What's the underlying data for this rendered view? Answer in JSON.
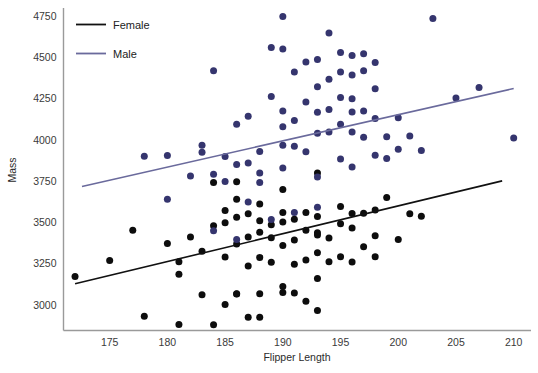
{
  "chart_data": {
    "type": "scatter",
    "title": "",
    "xlabel": "Flipper Length",
    "ylabel": "Mass",
    "xlim": [
      171.0,
      211.5
    ],
    "ylim": [
      2845,
      4800
    ],
    "xticks": [
      175,
      180,
      185,
      190,
      195,
      200,
      205,
      210
    ],
    "yticks": [
      3000,
      3250,
      3500,
      3750,
      4000,
      4250,
      4500,
      4750
    ],
    "grid": false,
    "legend_position": "top-left",
    "legend": [
      "Female",
      "Male"
    ],
    "colors": {
      "female_point": "#0d0d0d",
      "female_line": "#111111",
      "male_point": "#35356e",
      "male_line": "#6a6a9c",
      "axis": "#9a9a9a",
      "text": "#2b2b2b"
    },
    "series": [
      {
        "name": "Female",
        "marker_color": "#0d0d0d",
        "line_color": "#111111",
        "trend_line": {
          "x0": 172.0,
          "y0": 3128,
          "x1": 209.0,
          "y1": 3752
        },
        "points": [
          [
            172.0,
            3172
          ],
          [
            175.0,
            3270
          ],
          [
            177.0,
            3452
          ],
          [
            178.0,
            2932
          ],
          [
            180.0,
            3372
          ],
          [
            181.0,
            3262
          ],
          [
            181.0,
            3186
          ],
          [
            181.0,
            2882
          ],
          [
            182.0,
            3412
          ],
          [
            183.0,
            3062
          ],
          [
            183.0,
            3325
          ],
          [
            184.0,
            2880
          ],
          [
            184.0,
            3480
          ],
          [
            184.0,
            3742
          ],
          [
            185.0,
            3002
          ],
          [
            185.0,
            3498
          ],
          [
            185.0,
            3572
          ],
          [
            185.0,
            3290
          ],
          [
            186.0,
            3066
          ],
          [
            186.0,
            3068
          ],
          [
            186.0,
            3370
          ],
          [
            186.0,
            3532
          ],
          [
            186.0,
            3640
          ],
          [
            186.0,
            3746
          ],
          [
            187.0,
            2926
          ],
          [
            187.0,
            3236
          ],
          [
            187.0,
            3412
          ],
          [
            187.0,
            3552
          ],
          [
            188.0,
            2925
          ],
          [
            188.0,
            3068
          ],
          [
            188.0,
            3288
          ],
          [
            188.0,
            3440
          ],
          [
            188.0,
            3510
          ],
          [
            188.0,
            3612
          ],
          [
            189.0,
            3258
          ],
          [
            189.0,
            3408
          ],
          [
            189.0,
            3486
          ],
          [
            190.0,
            3076
          ],
          [
            190.0,
            3112
          ],
          [
            190.0,
            3360
          ],
          [
            190.0,
            3502
          ],
          [
            190.0,
            3560
          ],
          [
            190.0,
            3700
          ],
          [
            191.0,
            3072
          ],
          [
            191.0,
            3246
          ],
          [
            191.0,
            3394
          ],
          [
            191.0,
            3520
          ],
          [
            192.0,
            3022
          ],
          [
            192.0,
            3272
          ],
          [
            192.0,
            3452
          ],
          [
            192.0,
            3560
          ],
          [
            193.0,
            2966
          ],
          [
            193.0,
            3160
          ],
          [
            193.0,
            3316
          ],
          [
            193.0,
            3424
          ],
          [
            193.0,
            3438
          ],
          [
            193.0,
            3536
          ],
          [
            193.0,
            3800
          ],
          [
            194.0,
            3262
          ],
          [
            194.0,
            3406
          ],
          [
            195.0,
            3292
          ],
          [
            195.0,
            3492
          ],
          [
            195.0,
            3596
          ],
          [
            196.0,
            3260
          ],
          [
            196.0,
            3466
          ],
          [
            196.0,
            3554
          ],
          [
            197.0,
            3352
          ],
          [
            197.0,
            3556
          ],
          [
            198.0,
            3292
          ],
          [
            198.0,
            3420
          ],
          [
            198.0,
            3576
          ],
          [
            199.0,
            3652
          ],
          [
            200.0,
            3396
          ],
          [
            201.0,
            3552
          ],
          [
            202.0,
            3538
          ]
        ]
      },
      {
        "name": "Male",
        "marker_color": "#35356e",
        "line_color": "#6a6a9c",
        "trend_line": {
          "x0": 172.6,
          "y0": 3718,
          "x1": 210.0,
          "y1": 4312
        },
        "points": [
          [
            178.0,
            3902
          ],
          [
            180.0,
            3906
          ],
          [
            180.0,
            3640
          ],
          [
            182.0,
            3782
          ],
          [
            183.0,
            3926
          ],
          [
            183.0,
            3968
          ],
          [
            184.0,
            3792
          ],
          [
            184.0,
            4420
          ],
          [
            184.0,
            3450
          ],
          [
            185.0,
            3748
          ],
          [
            185.0,
            3900
          ],
          [
            186.0,
            3852
          ],
          [
            186.0,
            4096
          ],
          [
            186.0,
            3396
          ],
          [
            187.0,
            3860
          ],
          [
            187.0,
            4144
          ],
          [
            187.0,
            3624
          ],
          [
            188.0,
            3742
          ],
          [
            188.0,
            3800
          ],
          [
            188.0,
            3930
          ],
          [
            189.0,
            3518
          ],
          [
            189.0,
            4264
          ],
          [
            189.0,
            4560
          ],
          [
            190.0,
            3830
          ],
          [
            190.0,
            3968
          ],
          [
            190.0,
            4080
          ],
          [
            190.0,
            4176
          ],
          [
            190.0,
            4552
          ],
          [
            190.0,
            4748
          ],
          [
            191.0,
            3560
          ],
          [
            191.0,
            3962
          ],
          [
            191.0,
            4118
          ],
          [
            191.0,
            4412
          ],
          [
            192.0,
            3928
          ],
          [
            192.0,
            4230
          ],
          [
            192.0,
            4472
          ],
          [
            193.0,
            3592
          ],
          [
            193.0,
            3776
          ],
          [
            193.0,
            4040
          ],
          [
            193.0,
            4168
          ],
          [
            193.0,
            4322
          ],
          [
            193.0,
            4488
          ],
          [
            194.0,
            4048
          ],
          [
            194.0,
            4184
          ],
          [
            194.0,
            4368
          ],
          [
            194.0,
            4648
          ],
          [
            195.0,
            3884
          ],
          [
            195.0,
            4096
          ],
          [
            195.0,
            4258
          ],
          [
            195.0,
            4412
          ],
          [
            195.0,
            4530
          ],
          [
            196.0,
            3836
          ],
          [
            196.0,
            4048
          ],
          [
            196.0,
            4170
          ],
          [
            196.0,
            4250
          ],
          [
            196.0,
            4394
          ],
          [
            196.0,
            4512
          ],
          [
            197.0,
            4016
          ],
          [
            197.0,
            4176
          ],
          [
            197.0,
            4420
          ],
          [
            197.0,
            4522
          ],
          [
            198.0,
            3908
          ],
          [
            198.0,
            4130
          ],
          [
            198.0,
            4310
          ],
          [
            198.0,
            4470
          ],
          [
            199.0,
            4020
          ],
          [
            199.0,
            3888
          ],
          [
            200.0,
            3944
          ],
          [
            200.0,
            4134
          ],
          [
            201.0,
            4024
          ],
          [
            202.0,
            3936
          ],
          [
            203.0,
            4736
          ],
          [
            205.0,
            4254
          ],
          [
            207.0,
            4318
          ],
          [
            210.0,
            4012
          ]
        ]
      }
    ]
  },
  "axes": {
    "x_title": "Flipper Length",
    "y_title": "Mass",
    "x_tick_labels": [
      "175",
      "180",
      "185",
      "190",
      "195",
      "200",
      "205",
      "210"
    ],
    "y_tick_labels": [
      "3000",
      "3250",
      "3500",
      "3750",
      "4000",
      "4250",
      "4500",
      "4750"
    ]
  },
  "legend": {
    "items": [
      {
        "label": "Female",
        "color": "#111111"
      },
      {
        "label": "Male",
        "color": "#6a6a9c"
      }
    ]
  }
}
